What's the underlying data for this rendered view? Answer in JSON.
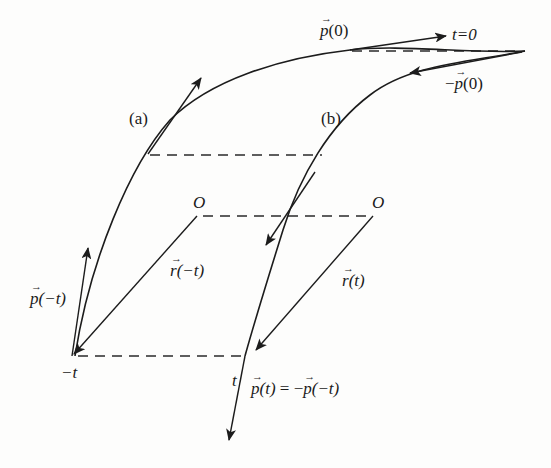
{
  "figure": {
    "type": "physics-diagram"
  },
  "labels": {
    "curve_a": "(a)",
    "curve_b": "(b)",
    "origin_left": "O",
    "origin_right": "O",
    "time_zero": "t=0",
    "p0": {
      "vec": "p",
      "arg": "(0)"
    },
    "neg_p0": {
      "prefix": "−",
      "vec": "p",
      "arg": "(0)"
    },
    "r_neg_t": {
      "vec": "r",
      "arg": "(−t)"
    },
    "r_t": {
      "vec": "r",
      "arg": "(t)"
    },
    "p_neg_t": {
      "vec": "p",
      "arg": "(−t)"
    },
    "neg_t_point": "−t",
    "t_point": "t",
    "p_t_equation": {
      "lhs_vec": "p",
      "lhs_arg": "(t)",
      "eq": " = −",
      "rhs_vec": "p",
      "rhs_arg": "(−t)"
    }
  },
  "colors": {
    "stroke": "#1c1c1c",
    "background": "#fdfdfc"
  }
}
